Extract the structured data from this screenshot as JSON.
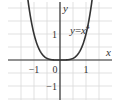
{
  "chart_data": {
    "type": "line",
    "title": "",
    "equation_label": "y = x^4",
    "equation_text": {
      "lhs": "y",
      "eq": "=",
      "base": "x",
      "exp": "4"
    },
    "xlabel": "x",
    "ylabel": "y",
    "xlim": [
      -1.5,
      1.5
    ],
    "ylim": [
      -1.5,
      2.5
    ],
    "x_ticks": [
      -1,
      0,
      1
    ],
    "x_tick_labels": [
      "−1",
      "0",
      "1"
    ],
    "y_ticks": [
      1,
      -1
    ],
    "y_tick_labels": [
      "1",
      "−1"
    ],
    "grid": true,
    "grid_step": 0.5,
    "series": [
      {
        "name": "y = x^4",
        "function": "x^4",
        "x": [
          -1.26,
          -1.2,
          -1.1,
          -1.0,
          -0.9,
          -0.8,
          -0.7,
          -0.6,
          -0.5,
          -0.4,
          -0.3,
          -0.2,
          -0.1,
          0,
          0.1,
          0.2,
          0.3,
          0.4,
          0.5,
          0.6,
          0.7,
          0.8,
          0.9,
          1.0,
          1.1,
          1.2,
          1.26
        ],
        "values": [
          2.52,
          2.07,
          1.46,
          1.0,
          0.66,
          0.41,
          0.24,
          0.13,
          0.06,
          0.03,
          0.01,
          0.0,
          0.0,
          0,
          0.0,
          0.0,
          0.01,
          0.03,
          0.06,
          0.13,
          0.24,
          0.41,
          0.66,
          1.0,
          1.46,
          2.07,
          2.52
        ]
      }
    ],
    "colors": {
      "curve": "#333333",
      "axes": "#333333",
      "grid": "#d9d9d9"
    }
  }
}
